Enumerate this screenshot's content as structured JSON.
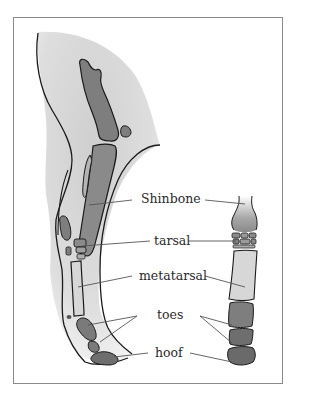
{
  "diagram": {
    "labels": [
      {
        "id": "shinbone",
        "text": "Shinbone"
      },
      {
        "id": "tarsal",
        "text": "tarsal"
      },
      {
        "id": "metatarsal",
        "text": "metatarsal"
      },
      {
        "id": "toes",
        "text": "toes"
      },
      {
        "id": "hoof",
        "text": "hoof"
      }
    ],
    "colors": {
      "frame": "#8a8a8a",
      "skin_shade": "#dcdcdc",
      "bone_dark": "#7a7a7a",
      "bone_light": "#d9d9d9",
      "outline": "#1a1a1a",
      "leader_line": "#555555"
    }
  }
}
